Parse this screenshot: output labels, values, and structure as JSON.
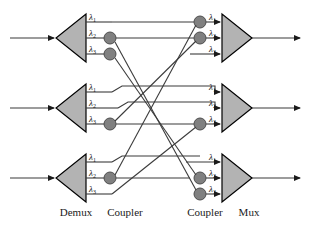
{
  "figure": {
    "background_color": "#ffffff",
    "line_color": "#3b3b3b",
    "triangle_fill": "#b3b3b3",
    "triangle_stroke": "#000000",
    "coupler_fill": "#808080",
    "coupler_stroke": "#4d4d4d",
    "text_color": "#1a1a1a"
  },
  "stage_labels": [
    {
      "id": "demux",
      "text": "Demux",
      "x": 76,
      "y": 214
    },
    {
      "id": "coupler-left",
      "text": "Coupler",
      "x": 125,
      "y": 214
    },
    {
      "id": "coupler-right",
      "text": "Coupler",
      "x": 205,
      "y": 214
    },
    {
      "id": "mux",
      "text": "Mux",
      "x": 249,
      "y": 214
    }
  ],
  "wavelengths": {
    "symbol": "λ",
    "subscripts": [
      "1",
      "2",
      "3"
    ]
  },
  "rows": [
    {
      "id": "row-1",
      "demux_label": "Demux",
      "mux_label": "Mux",
      "input_arrow": true,
      "output_arrow": true,
      "demux_channels": [
        {
          "lambda": "λ",
          "sub": "1",
          "has_coupler": false
        },
        {
          "lambda": "λ",
          "sub": "2",
          "has_coupler": true
        },
        {
          "lambda": "λ",
          "sub": "3",
          "has_coupler": true
        }
      ],
      "mux_channels": [
        {
          "lambda": "λ",
          "sub": "1",
          "has_coupler": true
        },
        {
          "lambda": "λ",
          "sub": "2",
          "has_coupler": true
        },
        {
          "lambda": "λ",
          "sub": "3",
          "has_coupler": false
        }
      ]
    },
    {
      "id": "row-2",
      "demux_label": "Demux",
      "mux_label": "Mux",
      "input_arrow": true,
      "output_arrow": true,
      "demux_channels": [
        {
          "lambda": "λ",
          "sub": "1",
          "has_coupler": false
        },
        {
          "lambda": "λ",
          "sub": "2",
          "has_coupler": false
        },
        {
          "lambda": "λ",
          "sub": "3",
          "has_coupler": true
        }
      ],
      "mux_channels": [
        {
          "lambda": "λ",
          "sub": "1",
          "has_coupler": false
        },
        {
          "lambda": "λ",
          "sub": "2",
          "has_coupler": false
        },
        {
          "lambda": "λ",
          "sub": "3",
          "has_coupler": true
        }
      ]
    },
    {
      "id": "row-3",
      "demux_label": "Demux",
      "mux_label": "Mux",
      "input_arrow": true,
      "output_arrow": true,
      "demux_channels": [
        {
          "lambda": "λ",
          "sub": "1",
          "has_coupler": false
        },
        {
          "lambda": "λ",
          "sub": "2",
          "has_coupler": true
        },
        {
          "lambda": "λ",
          "sub": "3",
          "has_coupler": false
        }
      ],
      "mux_channels": [
        {
          "lambda": "λ",
          "sub": "1",
          "has_coupler": false
        },
        {
          "lambda": "λ",
          "sub": "2",
          "has_coupler": true
        },
        {
          "lambda": "λ",
          "sub": "3",
          "has_coupler": true
        }
      ]
    }
  ],
  "geometry": {
    "demux_x_left": 56,
    "demux_x_right": 86,
    "mux_x_left": 222,
    "mux_x_right": 252,
    "coupler_left_x": 110,
    "coupler_right_x": 200,
    "coupler_radius": 6,
    "row_y_centers": [
      38,
      108,
      178
    ],
    "channel_offsets": [
      -16,
      0,
      16
    ],
    "input_line_x_start": 10,
    "output_line_x_end": 300
  },
  "cross_connections": [
    {
      "from": "r1c2",
      "to": "r3c3",
      "note": "row1 lambda2 to row3 lambda3"
    },
    {
      "from": "r1c3",
      "to": "r3c2",
      "note": "row1 lambda3 to row3 lambda2"
    },
    {
      "from": "r2c3",
      "to": "r1c2",
      "note": "row2 lambda3 to row1 lambda2"
    },
    {
      "from": "r3c2",
      "to": "r1c1",
      "note": "row3 lambda2 to row1 lambda1"
    },
    {
      "from": "r2c1",
      "to": "r2c1",
      "note": "straight jog"
    },
    {
      "from": "r2c2",
      "to": "r2c2",
      "note": "straight jog"
    },
    {
      "from": "r3c1",
      "to": "r3c1",
      "note": "straight jog"
    },
    {
      "from": "r3c3",
      "to": "r2c3",
      "note": "row3 lambda3 to row2 lambda3"
    }
  ]
}
